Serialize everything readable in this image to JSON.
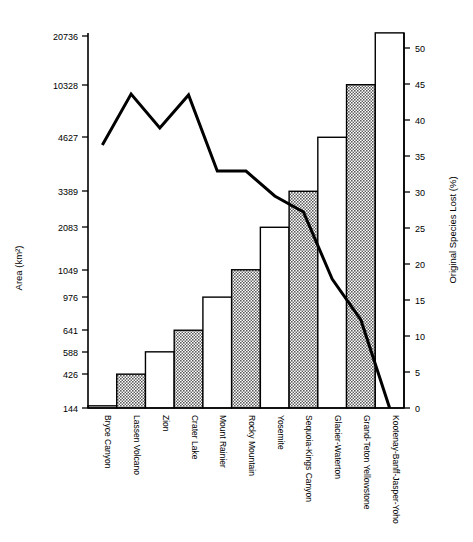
{
  "chart_data": {
    "type": "bar",
    "title": "",
    "xlabel": "",
    "ylabel": "Area (km²)",
    "y2label": "Original Species Lost (%)",
    "categories": [
      "Bryce Canyon",
      "Lassen Volcano",
      "Zion",
      "Crater Lake",
      "Mount Rainier",
      "Rocky Mountain",
      "Yosemite",
      "Sequoia-Kings Canyon",
      "Glacier-Waterton",
      "Grand-Teton Yellowstone",
      "Kootenay-Banff-Jasper-Yoho"
    ],
    "bar_series": {
      "name": "Original Species Lost (%)",
      "values": [
        0.3,
        4.7,
        7.8,
        10.8,
        15.4,
        19.2,
        25.1,
        30.1,
        37.6,
        44.9,
        52.1
      ],
      "fills": [
        "white",
        "hatched",
        "white",
        "hatched",
        "white",
        "hatched",
        "white",
        "hatched",
        "white",
        "hatched",
        "white"
      ]
    },
    "line_series": {
      "name": "Area (km²)",
      "area_values": [
        144,
        426,
        588,
        641,
        976,
        1049,
        2083,
        3389,
        4627,
        10328,
        20736
      ],
      "line_y_px": [
        145,
        94,
        128,
        95,
        171,
        171,
        196,
        212,
        279,
        320,
        408
      ]
    },
    "y_left_ticks": [
      {
        "label": "20736",
        "y": 36
      },
      {
        "label": "10328",
        "y": 85
      },
      {
        "label": "4627",
        "y": 137
      },
      {
        "label": "3389",
        "y": 191
      },
      {
        "label": "2083",
        "y": 227
      },
      {
        "label": "1049",
        "y": 270
      },
      {
        "label": "976",
        "y": 297
      },
      {
        "label": "641",
        "y": 330
      },
      {
        "label": "588",
        "y": 352
      },
      {
        "label": "426",
        "y": 374
      },
      {
        "label": "144",
        "y": 408
      }
    ],
    "y_right_ticks": [
      {
        "label": "50",
        "value": 50
      },
      {
        "label": "45",
        "value": 45
      },
      {
        "label": "40",
        "value": 40
      },
      {
        "label": "35",
        "value": 35
      },
      {
        "label": "30",
        "value": 30
      },
      {
        "label": "25",
        "value": 25
      },
      {
        "label": "20",
        "value": 20
      },
      {
        "label": "15",
        "value": 15
      },
      {
        "label": "10",
        "value": 10
      },
      {
        "label": "5",
        "value": 5
      },
      {
        "label": "0",
        "value": 0
      }
    ],
    "y2lim": [
      0,
      50
    ],
    "grid": false,
    "legend": "none",
    "colors": {
      "line": "#000000",
      "bar_edge": "#000000",
      "bar_white": "#ffffff",
      "bar_hatch": "#6b6b6b",
      "axis": "#000000",
      "background": "#ffffff"
    }
  }
}
